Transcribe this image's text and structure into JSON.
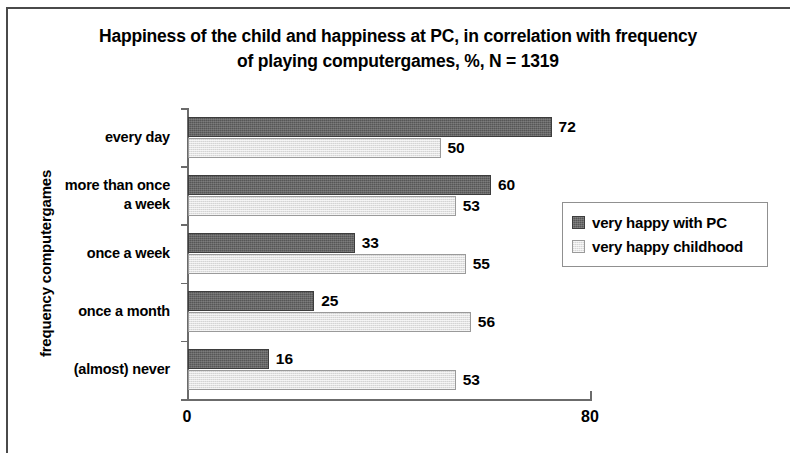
{
  "chart_data": {
    "type": "bar",
    "orientation": "horizontal",
    "title": "Happiness of the child and happiness at PC, in correlation with frequency of playing computergames, %, N = 1319",
    "title_lines": [
      "Happiness of the child and happiness at PC, in correlation with frequency",
      "of playing computergames, %, N = 1319"
    ],
    "xlabel": "",
    "ylabel": "frequency computergames",
    "xlim": [
      0,
      80
    ],
    "x_tick_labels": [
      "0",
      "80"
    ],
    "grid": false,
    "legend_position": "middle-right",
    "categories": [
      "every day",
      "more than once a week",
      "once a week",
      "once a month",
      "(almost) never"
    ],
    "category_label_lines": [
      [
        "every day"
      ],
      [
        "more than once",
        "a week"
      ],
      [
        "once a week"
      ],
      [
        "once a month"
      ],
      [
        "(almost) never"
      ]
    ],
    "series": [
      {
        "name": "very happy with PC",
        "color": "#565656",
        "values": [
          72,
          60,
          33,
          25,
          16
        ]
      },
      {
        "name": "very happy childhood",
        "color": "#e2e2e2",
        "values": [
          50,
          53,
          55,
          56,
          53
        ]
      }
    ]
  }
}
